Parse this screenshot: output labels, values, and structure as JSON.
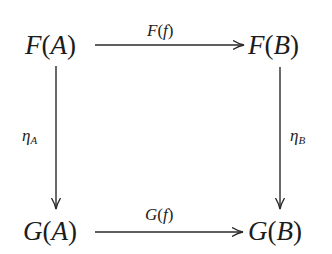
{
  "diagram": {
    "type": "commutative-square",
    "nodes": {
      "top_left": {
        "functor": "F",
        "object": "A"
      },
      "top_right": {
        "functor": "F",
        "object": "B"
      },
      "bottom_left": {
        "functor": "G",
        "object": "A"
      },
      "bottom_right": {
        "functor": "G",
        "object": "B"
      }
    },
    "arrows": {
      "top": {
        "functor": "F",
        "arg": "f",
        "from": "F(A)",
        "to": "F(B)"
      },
      "bottom": {
        "functor": "G",
        "arg": "f",
        "from": "G(A)",
        "to": "G(B)"
      },
      "left": {
        "symbol": "η",
        "subscript": "A",
        "from": "F(A)",
        "to": "G(A)"
      },
      "right": {
        "symbol": "η",
        "subscript": "B",
        "from": "F(B)",
        "to": "G(B)"
      }
    },
    "parens": {
      "open": "(",
      "close": ")"
    },
    "colors": {
      "ink": "#1c1c1c",
      "background": "#ffffff"
    }
  }
}
